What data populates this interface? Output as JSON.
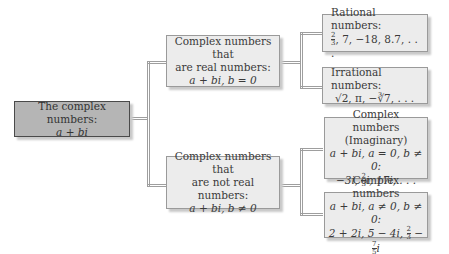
{
  "diagram": {
    "root": {
      "line1": "The complex numbers:",
      "line2": "a + bi"
    },
    "real": {
      "line1": "Complex numbers that",
      "line2": "are real numbers:",
      "line3": "a + bi, b = 0"
    },
    "nonreal": {
      "line1": "Complex numbers that",
      "line2": "are not real numbers:",
      "line3": "a + bi, b ≠ 0"
    },
    "rational": {
      "line1": "Rational numbers:",
      "examples": ", 7, −18, 8.7, . . .",
      "frac_num": "2",
      "frac_den": "3"
    },
    "irrational": {
      "line1": "Irrational numbers:",
      "examples": "√2, π, −∛7, . . ."
    },
    "imaginary": {
      "line1": "Complex numbers",
      "line2": "(Imaginary)",
      "line3": "a + bi, a = 0, b ≠ 0:",
      "line4_pre": "−3i, ",
      "frac_num": "2",
      "frac_den": "3",
      "line4_post": "i, 17i, . . ."
    },
    "complex": {
      "line1": "Complex numbers",
      "line2": "a + bi, a ≠ 0, b ≠ 0:",
      "line3_pre": "2 + 2i, 5 − 4i, ",
      "frac1_num": "2",
      "frac1_den": "3",
      "mid": " − ",
      "frac2_num": "7",
      "frac2_den": "5",
      "line3_post": "i"
    },
    "colors": {
      "root_fill": "#b5b5b5",
      "box_fill": "#ececec",
      "line": "#9e9e9e"
    }
  }
}
